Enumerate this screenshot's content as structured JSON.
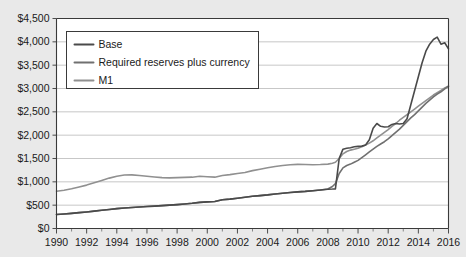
{
  "chart_data": {
    "type": "line",
    "title": "",
    "xlabel": "",
    "ylabel": "",
    "xlim": [
      1990,
      2016
    ],
    "ylim": [
      0,
      4500
    ],
    "ytick_step": 500,
    "xtick_step": 2,
    "grid": true,
    "legend_position": "top-left inside plot",
    "ytick_labels": [
      "$0",
      "$500",
      "$1,000",
      "$1,500",
      "$2,000",
      "$2,500",
      "$3,000",
      "$3,500",
      "$4,000",
      "$4,500"
    ],
    "ytick_values": [
      0,
      500,
      1000,
      1500,
      2000,
      2500,
      3000,
      3500,
      4000,
      4500
    ],
    "xtick_labels": [
      "1990",
      "1992",
      "1994",
      "1996",
      "1998",
      "2000",
      "2002",
      "2004",
      "2006",
      "2008",
      "2010",
      "2012",
      "2014",
      "2016"
    ],
    "xtick_values": [
      1990,
      1992,
      1994,
      1996,
      1998,
      2000,
      2002,
      2004,
      2006,
      2008,
      2010,
      2012,
      2014,
      2016
    ],
    "colors": {
      "base": "#4a4a4a",
      "reserves": "#707070",
      "m1": "#909090",
      "gridline": "#b9b9b9",
      "axis": "#3a3a3a",
      "plot_background": "#ffffff",
      "page_background": "#e9e9e9"
    },
    "x": [
      1990,
      1990.5,
      1991,
      1991.5,
      1992,
      1992.5,
      1993,
      1993.5,
      1994,
      1994.5,
      1995,
      1995.5,
      1996,
      1996.5,
      1997,
      1997.5,
      1998,
      1998.5,
      1999,
      1999.5,
      2000,
      2000.5,
      2001,
      2001.5,
      2002,
      2002.5,
      2003,
      2003.5,
      2004,
      2004.5,
      2005,
      2005.5,
      2006,
      2006.5,
      2007,
      2007.5,
      2008,
      2008.3,
      2008.5,
      2008.75,
      2009,
      2009.25,
      2009.5,
      2009.75,
      2010,
      2010.25,
      2010.5,
      2010.75,
      2011,
      2011.25,
      2011.5,
      2011.75,
      2012,
      2012.25,
      2012.5,
      2012.75,
      2013,
      2013.25,
      2013.5,
      2013.75,
      2014,
      2014.25,
      2014.5,
      2014.75,
      2015,
      2015.25,
      2015.5,
      2015.75,
      2016
    ],
    "series": [
      {
        "name": "Base",
        "color": "#4a4a4a",
        "values": [
          300,
          312,
          325,
          340,
          355,
          372,
          390,
          408,
          425,
          438,
          450,
          460,
          470,
          480,
          490,
          500,
          512,
          525,
          540,
          560,
          570,
          580,
          615,
          630,
          650,
          670,
          690,
          705,
          720,
          740,
          755,
          770,
          785,
          795,
          810,
          825,
          840,
          845,
          850,
          1500,
          1700,
          1720,
          1730,
          1750,
          1760,
          1765,
          1790,
          1900,
          2150,
          2250,
          2190,
          2175,
          2180,
          2230,
          2250,
          2240,
          2250,
          2350,
          2650,
          2950,
          3250,
          3550,
          3800,
          3950,
          4050,
          4100,
          3950,
          3980,
          3850
        ]
      },
      {
        "name": "Required reserves plus currency",
        "color": "#707070",
        "values": [
          300,
          312,
          325,
          340,
          355,
          372,
          390,
          408,
          425,
          438,
          450,
          460,
          470,
          480,
          490,
          500,
          512,
          525,
          540,
          560,
          570,
          580,
          615,
          630,
          650,
          670,
          690,
          705,
          720,
          740,
          755,
          770,
          785,
          795,
          810,
          825,
          845,
          900,
          960,
          1180,
          1300,
          1350,
          1380,
          1420,
          1460,
          1520,
          1580,
          1640,
          1700,
          1760,
          1810,
          1860,
          1920,
          1990,
          2060,
          2130,
          2210,
          2290,
          2370,
          2440,
          2520,
          2600,
          2680,
          2750,
          2820,
          2880,
          2930,
          2990,
          3050
        ]
      },
      {
        "name": "M1",
        "color": "#909090",
        "values": [
          800,
          820,
          850,
          890,
          930,
          980,
          1030,
          1080,
          1120,
          1145,
          1150,
          1135,
          1120,
          1105,
          1090,
          1085,
          1090,
          1095,
          1100,
          1120,
          1110,
          1100,
          1135,
          1155,
          1180,
          1200,
          1240,
          1270,
          1300,
          1330,
          1350,
          1365,
          1375,
          1370,
          1365,
          1370,
          1380,
          1400,
          1420,
          1500,
          1600,
          1650,
          1680,
          1700,
          1720,
          1750,
          1790,
          1830,
          1880,
          1940,
          2000,
          2060,
          2120,
          2190,
          2250,
          2320,
          2380,
          2440,
          2500,
          2560,
          2620,
          2680,
          2740,
          2800,
          2860,
          2910,
          2960,
          3010,
          3050
        ]
      }
    ],
    "legend": [
      {
        "label": "Base",
        "color": "#4a4a4a"
      },
      {
        "label": "Required reserves plus currency",
        "color": "#707070"
      },
      {
        "label": "M1",
        "color": "#909090"
      }
    ]
  }
}
